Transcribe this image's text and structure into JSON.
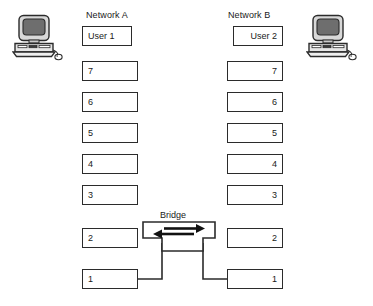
{
  "diagram": {
    "colors": {
      "line": "#2b2b2b",
      "background": "#ffffff",
      "screen": "#6e6e6e",
      "case": "#d8d8d8"
    }
  },
  "network_a": {
    "title": "Network A",
    "align": "left",
    "layers": [
      {
        "label": "User 1"
      },
      {
        "label": "7"
      },
      {
        "label": "6"
      },
      {
        "label": "5"
      },
      {
        "label": "4"
      },
      {
        "label": "3"
      },
      {
        "label": "2"
      },
      {
        "label": "1"
      }
    ]
  },
  "network_b": {
    "title": "Network B",
    "align": "right",
    "layers": [
      {
        "label": "User 2"
      },
      {
        "label": "7"
      },
      {
        "label": "6"
      },
      {
        "label": "5"
      },
      {
        "label": "4"
      },
      {
        "label": "3"
      },
      {
        "label": "2"
      },
      {
        "label": "1"
      }
    ]
  },
  "bridge": {
    "label": "Bridge",
    "arrow_right": "arrow-right",
    "arrow_left": "arrow-left"
  },
  "computers": {
    "left": {
      "name": "User 1 workstation"
    },
    "right": {
      "name": "User 2 workstation"
    }
  }
}
